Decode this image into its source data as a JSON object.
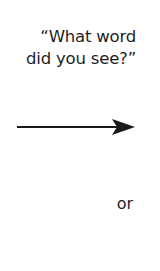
{
  "question": {
    "line1": "“What word",
    "line2": "did you see?”"
  },
  "arrow": {
    "direction": "right",
    "color": "#1a1a1a"
  },
  "connector_text": "or"
}
